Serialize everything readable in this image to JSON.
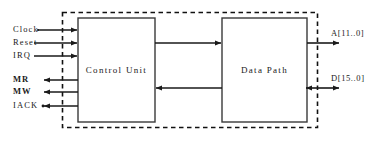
{
  "diagram": {
    "outer_boundary": {
      "style": "dashed",
      "color": "#111111"
    },
    "blocks": [
      {
        "id": "control-unit",
        "label": "Control Unit",
        "x": 78,
        "y": 18,
        "w": 77,
        "h": 104
      },
      {
        "id": "data-path",
        "label": "Data Path",
        "x": 222,
        "y": 18,
        "w": 85,
        "h": 104
      }
    ],
    "left_inputs": [
      {
        "id": "clock",
        "label": "Clock",
        "y": 30,
        "direction": "in"
      },
      {
        "id": "reset",
        "label": "Reset",
        "y": 43,
        "direction": "in"
      },
      {
        "id": "irq",
        "label": "IRQ",
        "y": 56,
        "direction": "in"
      }
    ],
    "left_outputs": [
      {
        "id": "mr",
        "label": "MR",
        "y": 80,
        "direction": "out"
      },
      {
        "id": "mw",
        "label": "MW",
        "y": 92,
        "direction": "out"
      },
      {
        "id": "iack",
        "label": "IACK",
        "y": 106,
        "direction": "out-dot"
      }
    ],
    "right_buses": [
      {
        "id": "address-bus",
        "label": "A[11..0]",
        "y": 43,
        "direction": "out"
      },
      {
        "id": "data-bus",
        "label": "D[15..0]",
        "y": 88,
        "direction": "bidirectional"
      }
    ],
    "internal_arrows": [
      {
        "id": "cu-to-dp",
        "y": 43,
        "direction": "right"
      },
      {
        "id": "dp-to-cu",
        "y": 88,
        "direction": "left"
      }
    ],
    "colors": {
      "line": "#1a1a1a",
      "block_border": "#3a3a3a",
      "background": "#ffffff"
    }
  }
}
